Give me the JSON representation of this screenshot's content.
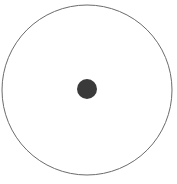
{
  "figure": {
    "name": "circle-with-center-point",
    "title": "Circle with center point",
    "canvas": {
      "width": 177,
      "height": 184,
      "background_color": "#ffffff"
    },
    "shapes": {
      "outline_circle": {
        "label": "outline-circle",
        "center_x": 87,
        "center_y": 90,
        "radius": 85,
        "stroke_color": "#6b6b6b",
        "stroke_width": 1,
        "fill": "none"
      },
      "center_dot": {
        "label": "center-dot",
        "center_x": 87,
        "center_y": 89,
        "radius": 10,
        "fill_color": "#3a3a3a",
        "stroke": "none"
      }
    }
  }
}
